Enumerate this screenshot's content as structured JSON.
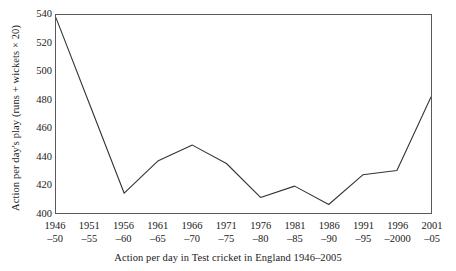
{
  "chart_data": {
    "type": "line",
    "title": "",
    "xlabel": "Action per day in Test cricket in England 1946–2005",
    "ylabel": "Action per day's play (runs + wickets × 20)",
    "categories": [
      "1946–50",
      "1951–55",
      "1956–60",
      "1961–65",
      "1966–70",
      "1971–75",
      "1976–80",
      "1981–85",
      "1986–90",
      "1991–95",
      "1996–2000",
      "2001–05"
    ],
    "category_lines": [
      {
        "line1": "1946",
        "line2": "–50"
      },
      {
        "line1": "1951",
        "line2": "–55"
      },
      {
        "line1": "1956",
        "line2": "–60"
      },
      {
        "line1": "1961",
        "line2": "–65"
      },
      {
        "line1": "1966",
        "line2": "–70"
      },
      {
        "line1": "1971",
        "line2": "–75"
      },
      {
        "line1": "1976",
        "line2": "–80"
      },
      {
        "line1": "1981",
        "line2": "–85"
      },
      {
        "line1": "1986",
        "line2": "–90"
      },
      {
        "line1": "1991",
        "line2": "–95"
      },
      {
        "line1": "1996",
        "line2": "–2000"
      },
      {
        "line1": "2001",
        "line2": "–05"
      }
    ],
    "values": [
      538,
      476,
      414,
      437,
      448,
      435,
      411,
      419,
      406,
      427,
      430,
      482
    ],
    "ylim": [
      400,
      540
    ],
    "yticks": [
      400,
      420,
      440,
      460,
      480,
      500,
      520,
      540
    ],
    "ytick_labels": [
      "400",
      "420",
      "440",
      "460",
      "480",
      "500",
      "520",
      "540"
    ],
    "grid": false,
    "legend": "none",
    "line_color": "#333333",
    "border_color": "#5a5a5a",
    "background_color": "#ffffff",
    "markers": false
  }
}
